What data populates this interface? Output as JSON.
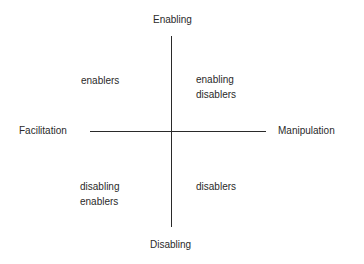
{
  "diagram": {
    "axes": {
      "top": "Enabling",
      "bottom": "Disabling",
      "left": "Facilitation",
      "right": "Manipulation"
    },
    "quadrants": {
      "top_left": [
        "enablers"
      ],
      "top_right": [
        "enabling",
        "disablers"
      ],
      "bottom_left": [
        "disabling",
        "enablers"
      ],
      "bottom_right": [
        "disablers"
      ]
    },
    "colors": {
      "line": "#2a2a2a",
      "text": "#2a2a2a",
      "background": "#ffffff"
    }
  }
}
